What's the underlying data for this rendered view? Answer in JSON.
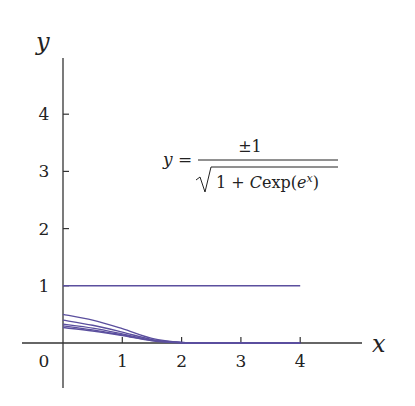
{
  "chart_data": {
    "type": "line",
    "title": "",
    "xlabel": "x",
    "ylabel": "y",
    "xlim": [
      -0.3,
      5.3
    ],
    "ylim": [
      -0.7,
      5.0
    ],
    "x_ticks": [
      "0",
      "1",
      "2",
      "3",
      "4"
    ],
    "y_ticks": [
      "1",
      "2",
      "3",
      "4"
    ],
    "grid": false,
    "annotation": {
      "lhs": "y =",
      "numerator": "±1",
      "denominator": "1 + C exp(e^x)"
    },
    "line_color": "#5b4f9e",
    "series": [
      {
        "name": "C=0",
        "x": [
          0,
          4
        ],
        "y": [
          1,
          1
        ]
      },
      {
        "name": "curve-1",
        "x": [
          0,
          0.5,
          1,
          1.5,
          2,
          2.5,
          3,
          4
        ],
        "y": [
          0.5,
          0.4,
          0.25,
          0.08,
          0.01,
          0,
          0,
          0
        ]
      },
      {
        "name": "curve-2",
        "x": [
          0,
          0.5,
          1,
          1.5,
          2,
          2.5,
          3,
          4
        ],
        "y": [
          0.4,
          0.31,
          0.19,
          0.06,
          0.01,
          0,
          0,
          0
        ]
      },
      {
        "name": "curve-3",
        "x": [
          0,
          0.5,
          1,
          1.5,
          2,
          2.5,
          3,
          4
        ],
        "y": [
          0.33,
          0.26,
          0.16,
          0.05,
          0.005,
          0,
          0,
          0
        ]
      },
      {
        "name": "curve-4",
        "x": [
          0,
          0.5,
          1,
          1.5,
          2,
          2.5,
          3,
          4
        ],
        "y": [
          0.3,
          0.23,
          0.14,
          0.045,
          0.005,
          0,
          0,
          0
        ]
      },
      {
        "name": "curve-5",
        "x": [
          0,
          0.5,
          1,
          1.5,
          2,
          2.5,
          3,
          4
        ],
        "y": [
          0.27,
          0.21,
          0.13,
          0.04,
          0.004,
          0,
          0,
          0
        ]
      }
    ]
  }
}
